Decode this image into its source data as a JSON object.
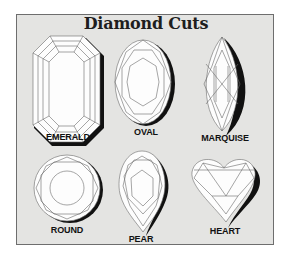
{
  "title": "Diamond Cuts",
  "colors": {
    "background": "#e4e4e2",
    "border": "#6e6e6e",
    "gem_fill": "#fdfdfd",
    "shadow": "#111111",
    "facet_line": "#6a6a6a"
  },
  "cuts": [
    {
      "id": "emerald",
      "label": "EMERALD"
    },
    {
      "id": "oval",
      "label": "OVAL"
    },
    {
      "id": "marquise",
      "label": "MARQUISE"
    },
    {
      "id": "round",
      "label": "ROUND"
    },
    {
      "id": "pear",
      "label": "PEAR"
    },
    {
      "id": "heart",
      "label": "HEART"
    }
  ]
}
